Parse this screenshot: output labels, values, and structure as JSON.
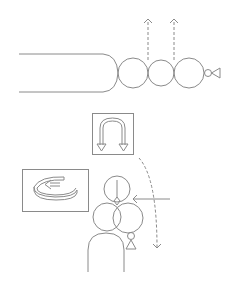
{
  "diagram": {
    "title": "",
    "colors": {
      "stroke": "#8a8a8a",
      "background": "#ffffff"
    },
    "panels": [
      {
        "id": "top-horizontal-assembly",
        "description": "Elongated body with a chain of three circles, small circle and triangle; two dashed upward arrows"
      },
      {
        "id": "u-turn-icon-box",
        "icon": "u-turn-arrow-icon"
      },
      {
        "id": "rotation-icon-box",
        "icon": "rotate-counterclockwise-icon"
      },
      {
        "id": "bottom-vertical-assembly",
        "description": "Vertical body with folded circles, inward horizontal arrow and curved dashed arrow"
      }
    ]
  }
}
